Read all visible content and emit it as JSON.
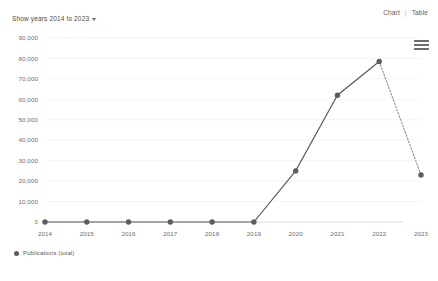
{
  "toolbar": {
    "show_years_label": "Show years 2014 to 2023",
    "caret_icon": "chevron-down-icon",
    "view_chart_label": "Chart",
    "view_separator": "|",
    "view_table_label": "Table",
    "menu_icon": "hamburger-menu-icon"
  },
  "legend": {
    "series_label": "Publications (total)",
    "marker_color": "#5d5d5d"
  },
  "chart_data": {
    "type": "line",
    "title": "",
    "xlabel": "",
    "ylabel": "",
    "categories": [
      "2014",
      "2015",
      "2016",
      "2017",
      "2018",
      "2019",
      "2020",
      "2021",
      "2022",
      "2023"
    ],
    "series": [
      {
        "name": "Publications (total)",
        "values": [
          0,
          0,
          0,
          0,
          0,
          0,
          25000,
          62000,
          78500,
          23000
        ],
        "color": "#5d5d5d"
      }
    ],
    "ylim": [
      0,
      90000
    ],
    "ytick_values": [
      0,
      10000,
      20000,
      30000,
      40000,
      50000,
      60000,
      70000,
      80000,
      90000
    ],
    "ytick_labels": [
      "0",
      "10,000",
      "20,000",
      "30,000",
      "40,000",
      "50,000",
      "60,000",
      "70,000",
      "80,000",
      "90,000"
    ],
    "grid": true,
    "legend_position": "bottom-left",
    "dotted_segment_from_index": 8,
    "dotted_segment_note": "2022 to 2023 segment rendered dotted (partial year)"
  }
}
